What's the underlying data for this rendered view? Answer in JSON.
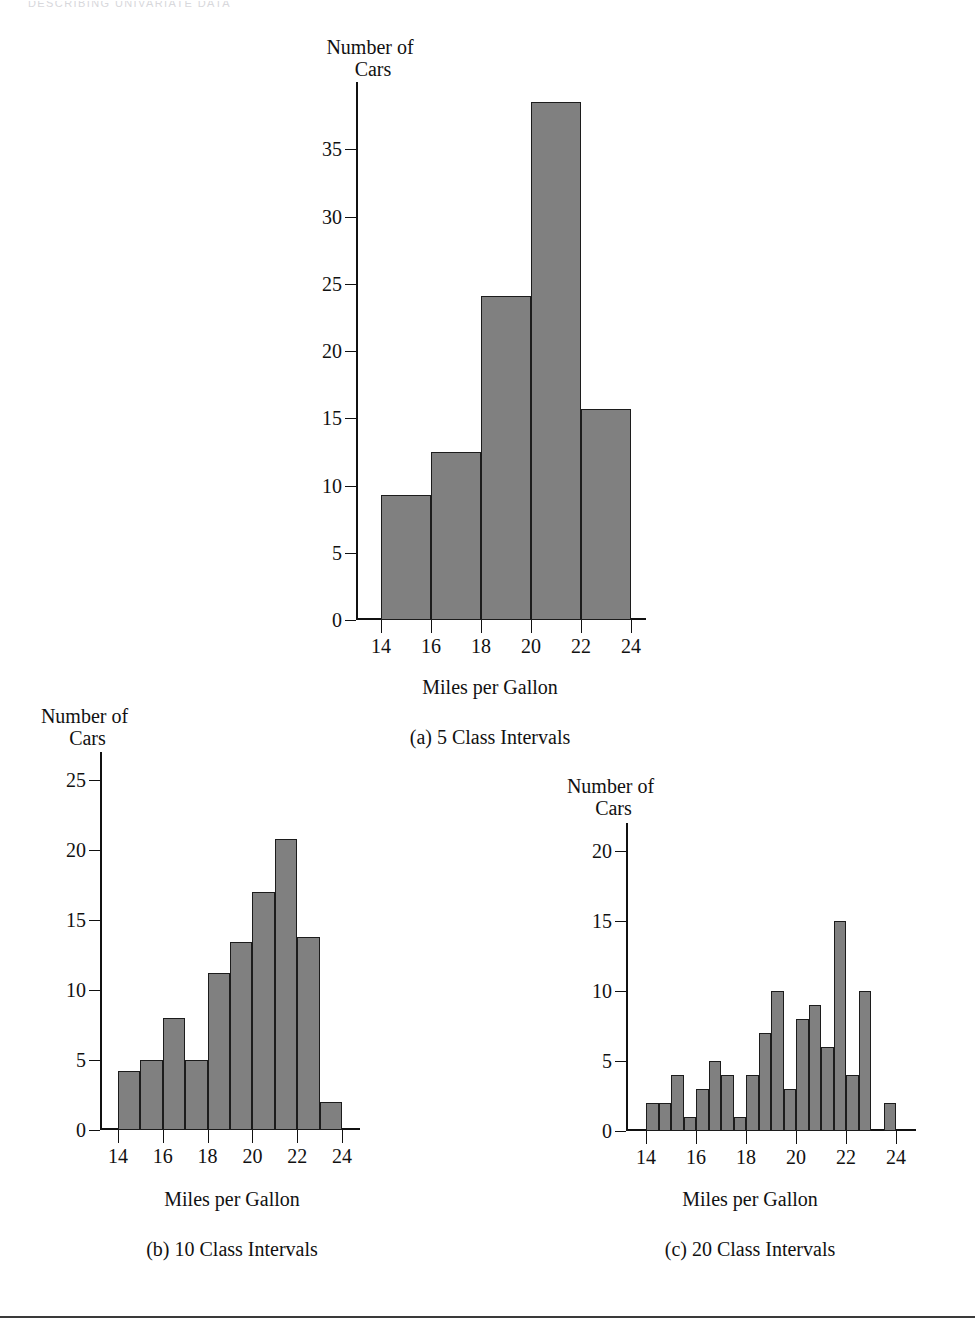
{
  "running_head": "DESCRIBING UNIVARIATE DATA",
  "figure": {
    "axis_title_line1": "Number of",
    "axis_title_line2": "Cars",
    "xlabel": "Miles per Gallon"
  },
  "chart_data": [
    {
      "type": "bar",
      "id": "a",
      "title": "(a) 5 Class Intervals",
      "xlabel": "Miles per Gallon",
      "ylabel": "Number of Cars",
      "xlim": [
        13,
        24.6
      ],
      "ylim": [
        0,
        40
      ],
      "xticks": [
        14,
        16,
        18,
        20,
        22,
        24
      ],
      "yticks": [
        0,
        5,
        10,
        15,
        20,
        25,
        30,
        35
      ],
      "grid": false,
      "legend": "none",
      "bin_edges": [
        14,
        16,
        18,
        20,
        22,
        24
      ],
      "values": [
        9.3,
        12.5,
        24.1,
        38.5,
        15.7
      ]
    },
    {
      "type": "bar",
      "id": "b",
      "title": "(b) 10 Class Intervals",
      "xlabel": "Miles per Gallon",
      "ylabel": "Number of Cars",
      "xlim": [
        13.2,
        24.8
      ],
      "ylim": [
        0,
        27
      ],
      "xticks": [
        14,
        16,
        18,
        20,
        22,
        24
      ],
      "yticks": [
        0,
        5,
        10,
        15,
        20,
        25
      ],
      "grid": false,
      "legend": "none",
      "bin_edges": [
        14,
        15,
        16,
        17,
        18,
        19,
        20,
        21,
        22,
        23,
        24
      ],
      "values": [
        4.2,
        5.0,
        8.0,
        5.0,
        11.2,
        13.4,
        17.0,
        20.8,
        13.8,
        2.0
      ]
    },
    {
      "type": "bar",
      "id": "c",
      "title": "(c) 20 Class Intervals",
      "xlabel": "Miles per Gallon",
      "ylabel": "Number of Cars",
      "xlim": [
        13.2,
        24.8
      ],
      "ylim": [
        0,
        22
      ],
      "xticks": [
        14,
        16,
        18,
        20,
        22,
        24
      ],
      "yticks": [
        0,
        5,
        10,
        15,
        20
      ],
      "grid": false,
      "legend": "none",
      "bin_edges": [
        14,
        14.5,
        15,
        15.5,
        16,
        16.5,
        17,
        17.5,
        18,
        18.5,
        19,
        19.5,
        20,
        20.5,
        21,
        21.5,
        22,
        22.5,
        23,
        23.5,
        24
      ],
      "values": [
        2,
        2,
        4,
        1,
        3,
        5,
        4,
        1,
        4,
        7,
        10,
        3,
        8,
        9,
        6,
        15,
        4,
        10,
        0,
        2
      ]
    }
  ]
}
